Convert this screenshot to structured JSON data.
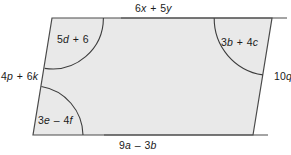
{
  "figure": {
    "kind": "parallelogram",
    "fill_color": "#e9e9e9",
    "stroke_color": "#4a4a4a",
    "arc_color": "#3c3c3c",
    "background_color": "#ffffff",
    "vertices": {
      "top_left": [
        52,
        18
      ],
      "top_right": [
        272,
        18
      ],
      "bottom_right": [
        253,
        135
      ],
      "bottom_left": [
        33,
        135
      ]
    },
    "sides": {
      "top": {
        "name": "top-side",
        "label": "6x + 5y",
        "parts": [
          {
            "t": "6",
            "i": false
          },
          {
            "t": "x",
            "i": true
          },
          {
            "t": " + ",
            "i": false
          },
          {
            "t": "5",
            "i": false
          },
          {
            "t": "y",
            "i": true
          }
        ]
      },
      "bottom": {
        "name": "bottom-side",
        "label": "9a – 3b",
        "parts": [
          {
            "t": "9",
            "i": false
          },
          {
            "t": "a",
            "i": true
          },
          {
            "t": " – ",
            "i": false
          },
          {
            "t": "3",
            "i": false
          },
          {
            "t": "b",
            "i": true
          }
        ]
      },
      "left": {
        "name": "left-side",
        "label": "4p + 6k",
        "parts": [
          {
            "t": "4",
            "i": false
          },
          {
            "t": "p",
            "i": true
          },
          {
            "t": " + ",
            "i": false
          },
          {
            "t": "6",
            "i": false
          },
          {
            "t": "k",
            "i": true
          }
        ]
      },
      "right": {
        "name": "right-side",
        "label": "10q",
        "parts": [
          {
            "t": "10",
            "i": false
          },
          {
            "t": "q",
            "i": true
          }
        ]
      }
    },
    "angles": [
      {
        "name": "angle-top-left",
        "corner": "top_left",
        "label": "5d + 6",
        "parts": [
          {
            "t": "5",
            "i": false
          },
          {
            "t": "d",
            "i": true
          },
          {
            "t": " + ",
            "i": false
          },
          {
            "t": "6",
            "i": false
          }
        ]
      },
      {
        "name": "angle-top-right",
        "corner": "top_right",
        "label": "3b + 4c",
        "parts": [
          {
            "t": "3",
            "i": false
          },
          {
            "t": "b",
            "i": true
          },
          {
            "t": " + ",
            "i": false
          },
          {
            "t": "4",
            "i": false
          },
          {
            "t": "c",
            "i": true
          }
        ]
      },
      {
        "name": "angle-bottom-left",
        "corner": "bottom_left",
        "label": "3e – 4f",
        "parts": [
          {
            "t": "3",
            "i": false
          },
          {
            "t": "e",
            "i": true
          },
          {
            "t": " – ",
            "i": false
          },
          {
            "t": "4",
            "i": false
          },
          {
            "t": "f",
            "i": true
          }
        ]
      }
    ]
  }
}
